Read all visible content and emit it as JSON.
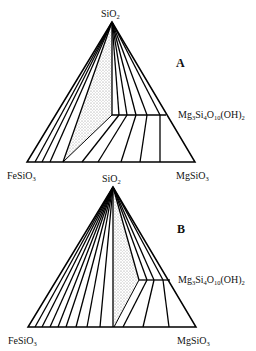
{
  "panels": [
    {
      "id": "A",
      "label": "A",
      "vertices": {
        "top": "SiO2",
        "left": "FeSiO3",
        "right": "MgSiO3",
        "side_phase": "Mg3Si4O10(OH)2"
      },
      "description": "Phase diagram with talc tie-lines; three-phase stippled field bounded by SiO2, talc and an Fe-Mg pyroxene"
    },
    {
      "id": "B",
      "label": "B",
      "vertices": {
        "top": "SiO2",
        "left": "FeSiO3",
        "right": "MgSiO3",
        "side_phase": "Mg3Si4O10(OH)2"
      },
      "description": "Phase diagram with restricted talc solid solution; stippled three-phase field shifted to the Mg side"
    }
  ],
  "labels": {
    "sio2": {
      "base": "SiO",
      "sub": "2"
    },
    "fesio3": {
      "base": "FeSiO",
      "sub": "3"
    },
    "mgsio3": {
      "base": "MgSiO",
      "sub": "3"
    },
    "talc": {
      "mg": "Mg",
      "mg_sub": "3",
      "si": "Si",
      "si_sub": "4",
      "o": "O",
      "o_sub": "10",
      "oh": "(OH)",
      "oh_sub": "2"
    }
  },
  "colors": {
    "line": "#000000",
    "stipple": "#bdbdbd"
  }
}
